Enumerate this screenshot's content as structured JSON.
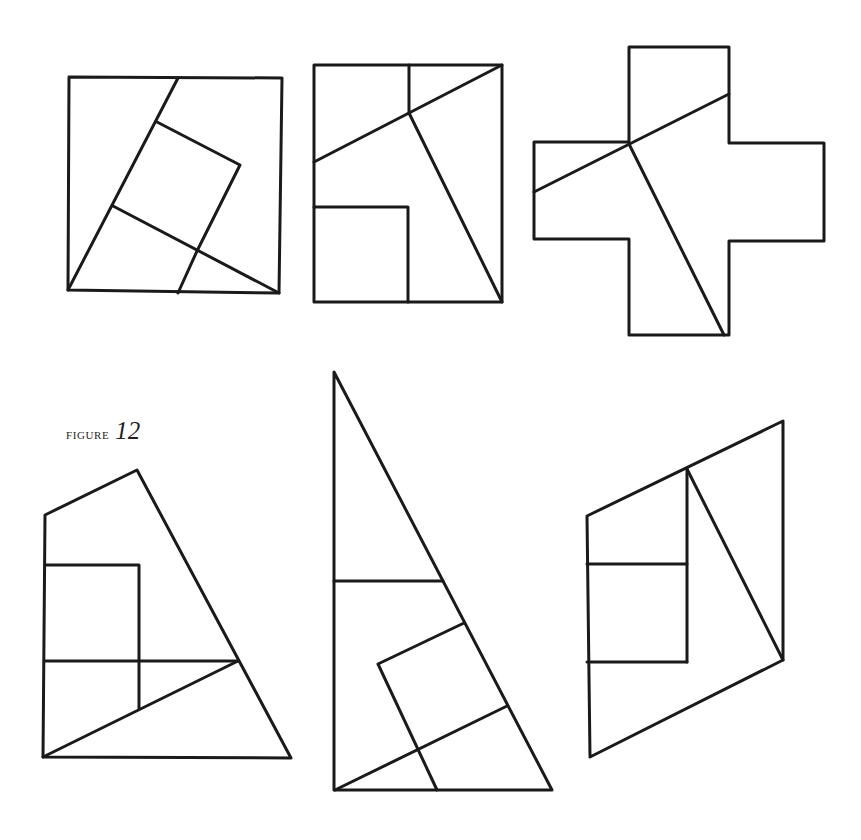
{
  "caption": {
    "word": "FIGURE",
    "number": "12"
  },
  "style": {
    "line_color": "#1a1a1a",
    "line_width": 3,
    "background": "#ffffff"
  },
  "figures": [
    {
      "id": "square-dissection",
      "paths": [
        "M69,77 L282,78 L279,293 L68,290 Z",
        "M68,290 L178,78",
        "M157,122 L240,165 L197,251 L178,293",
        "M113,206 L279,293"
      ]
    },
    {
      "id": "rectangle-dissection",
      "paths": [
        "M314,65 L502,65 L502,302 L314,302 Z",
        "M409,65 L409,113",
        "M314,162 L502,65",
        "M409,113 L502,302",
        "M314,207 L408,207 L408,302"
      ]
    },
    {
      "id": "cross-dissection",
      "paths": [
        "M629,47 L729,47 L729,143 L824,143 L824,241 L729,241 L729,335 L629,335 L629,239 L534,239 L534,142 L629,142 Z",
        "M534,192 L729,94",
        "M629,144 L724,335"
      ]
    },
    {
      "id": "pentagon-dissection",
      "paths": [
        "M43,757 L45,515 L137,470 L291,758 Z",
        "M45,565 L139,565 L139,708",
        "M45,661 L238,661",
        "M43,757 L238,661"
      ]
    },
    {
      "id": "triangle-dissection",
      "paths": [
        "M334,372 L334,790 L552,790 Z",
        "M334,581 L443,581",
        "M464,623 L378,664 L437,790",
        "M335,790 L507,706"
      ]
    },
    {
      "id": "parallelogram-dissection",
      "paths": [
        "M587,516 L783,421 L783,660 L590,757 Z",
        "M687,469 L687,662",
        "M587,564 L687,564",
        "M587,662 L687,662",
        "M687,469 L783,660"
      ]
    }
  ]
}
